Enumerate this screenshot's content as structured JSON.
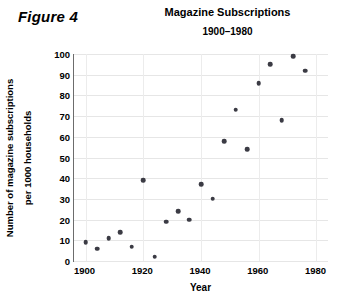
{
  "figure": {
    "label": "Figure 4"
  },
  "chart_data": {
    "type": "scatter",
    "title": "Magazine Subscriptions",
    "subtitle": "1900–1980",
    "xlabel": "Year",
    "ylabel": "Number of magazine subscriptions per 1000 households",
    "ylabel_line1": "Number of magazine subscriptions",
    "ylabel_line2": "per 1000 households",
    "xlim": [
      1896,
      1984
    ],
    "ylim": [
      0,
      100
    ],
    "xticks": [
      1900,
      1920,
      1940,
      1960,
      1980
    ],
    "yticks": [
      0,
      10,
      20,
      30,
      40,
      50,
      60,
      70,
      80,
      90,
      100
    ],
    "grid": true,
    "legend": "none",
    "marker_color": "#3b3b44",
    "series": [
      {
        "name": "Magazine subscriptions per 1000 households",
        "x": [
          1900,
          1904,
          1908,
          1912,
          1916,
          1920,
          1924,
          1928,
          1932,
          1936,
          1940,
          1944,
          1948,
          1952,
          1956,
          1960,
          1964,
          1968,
          1972,
          1976
        ],
        "y": [
          9,
          6,
          11,
          14,
          7,
          39,
          2,
          19,
          24,
          20,
          37,
          30,
          58,
          73,
          54,
          86,
          95,
          68,
          99,
          92
        ]
      }
    ],
    "points": [
      {
        "x": 1900,
        "y": 9
      },
      {
        "x": 1904,
        "y": 6
      },
      {
        "x": 1908,
        "y": 11
      },
      {
        "x": 1912,
        "y": 14
      },
      {
        "x": 1916,
        "y": 7
      },
      {
        "x": 1920,
        "y": 39
      },
      {
        "x": 1924,
        "y": 2
      },
      {
        "x": 1928,
        "y": 19
      },
      {
        "x": 1932,
        "y": 24
      },
      {
        "x": 1936,
        "y": 20
      },
      {
        "x": 1940,
        "y": 37
      },
      {
        "x": 1944,
        "y": 30
      },
      {
        "x": 1948,
        "y": 58
      },
      {
        "x": 1952,
        "y": 73
      },
      {
        "x": 1956,
        "y": 54
      },
      {
        "x": 1960,
        "y": 86
      },
      {
        "x": 1964,
        "y": 95
      },
      {
        "x": 1968,
        "y": 68
      },
      {
        "x": 1972,
        "y": 99
      },
      {
        "x": 1976,
        "y": 92
      }
    ]
  }
}
